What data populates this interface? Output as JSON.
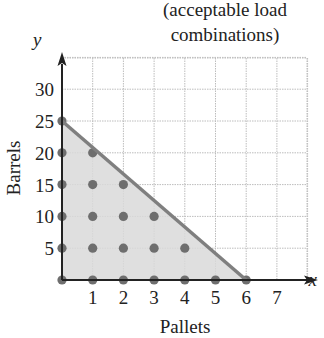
{
  "chart_data": {
    "type": "scatter",
    "title_lines": [
      "(acceptable load",
      "combinations)"
    ],
    "xlabel": "Pallets",
    "ylabel": "Barrels",
    "x_axis_var": "x",
    "y_axis_var": "y",
    "xlim": [
      0,
      7.8
    ],
    "ylim": [
      0,
      34
    ],
    "x_ticks": [
      1,
      2,
      3,
      4,
      5,
      6,
      7
    ],
    "y_ticks": [
      5,
      10,
      15,
      20,
      25,
      30
    ],
    "grid": true,
    "boundary_line": {
      "x1": 0,
      "y1": 25,
      "x2": 6,
      "y2": 0,
      "equation": "y = 25 - 25x/6"
    },
    "shaded_region": "triangle (0,0), (0,25), (6,0)",
    "points": [
      [
        0,
        0
      ],
      [
        1,
        0
      ],
      [
        2,
        0
      ],
      [
        3,
        0
      ],
      [
        4,
        0
      ],
      [
        5,
        0
      ],
      [
        6,
        0
      ],
      [
        0,
        5
      ],
      [
        1,
        5
      ],
      [
        2,
        5
      ],
      [
        3,
        5
      ],
      [
        4,
        5
      ],
      [
        0,
        10
      ],
      [
        1,
        10
      ],
      [
        2,
        10
      ],
      [
        3,
        10
      ],
      [
        0,
        15
      ],
      [
        1,
        15
      ],
      [
        2,
        15
      ],
      [
        0,
        20
      ],
      [
        1,
        20
      ],
      [
        0,
        25
      ]
    ],
    "colors": {
      "shade": "#d9d9d9",
      "line": "#7f7f7f",
      "point": "#6e6e6e",
      "grid": "#bdbdbd",
      "axis": "#222222"
    }
  }
}
